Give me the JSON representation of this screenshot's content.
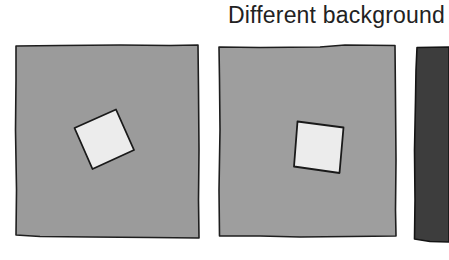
{
  "title": "Different background",
  "colors": {
    "page_background": "#ffffff",
    "panel_medium_gray": "#9a9a9a",
    "panel_medium_gray_2": "#9d9d9d",
    "panel_dark_gray": "#3c3c3c",
    "target_square_fill": "#e9e9e9",
    "outline": "#1e1e1e"
  },
  "panels": [
    {
      "name": "panel-medium-gray-rotated-square",
      "background": "medium gray",
      "square": "light gray square, rotated about -25 degrees"
    },
    {
      "name": "panel-medium-gray-tilted-square",
      "background": "medium gray",
      "square": "light gray square, tilted about 8 degrees"
    },
    {
      "name": "panel-dark-gray-partial",
      "background": "dark gray",
      "square": "not visible (cropped)"
    }
  ]
}
